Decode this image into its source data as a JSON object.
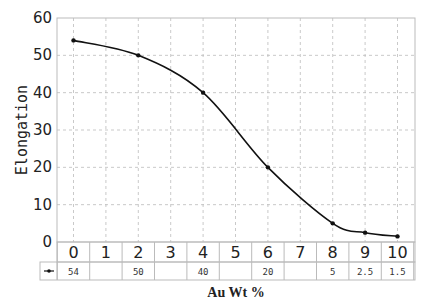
{
  "chart_data": {
    "type": "line",
    "title": "",
    "xlabel": "Au Wt %",
    "ylabel": "Elongation",
    "x": [
      0,
      1,
      2,
      3,
      4,
      5,
      6,
      7,
      8,
      9,
      10
    ],
    "categories": [
      "0",
      "1",
      "2",
      "3",
      "4",
      "5",
      "6",
      "7",
      "8",
      "9",
      "10"
    ],
    "series": [
      {
        "name": "Elongation",
        "x": [
          0,
          2,
          4,
          6,
          8,
          9,
          10
        ],
        "values": [
          54,
          50,
          40,
          20,
          5,
          2.5,
          1.5
        ],
        "color": "#111111",
        "marker": "circle"
      }
    ],
    "table_values": [
      "54",
      "",
      "50",
      "",
      "40",
      "",
      "20",
      "",
      "5",
      "2.5",
      "1.5"
    ],
    "ylim": [
      0,
      60
    ],
    "yticks": [
      0,
      10,
      20,
      30,
      40,
      50,
      60
    ],
    "xlim": [
      -0.5,
      10.5
    ],
    "grid": true,
    "grid_style": "dashed",
    "legend": {
      "position": "table-left",
      "entries": [
        "Elongation"
      ]
    }
  }
}
